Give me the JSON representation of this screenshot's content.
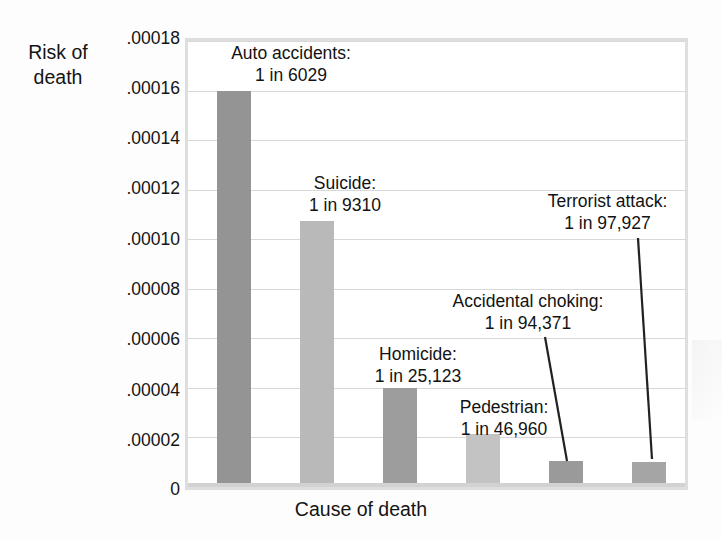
{
  "axes": {
    "y_title": "Risk of\ndeath",
    "x_title": "Cause of death",
    "y_ticks": [
      ".00018",
      ".00016",
      ".00014",
      ".00012",
      ".00010",
      ".00008",
      ".00006",
      ".00004",
      ".00002",
      "0"
    ]
  },
  "labels": {
    "auto": "Auto accidents:\n1 in 6029",
    "suicide": "Suicide:\n1 in 9310",
    "homicide": "Homicide:\n1 in 25,123",
    "pedestrian": "Pedestrian:\n1 in 46,960",
    "choking": "Accidental choking:\n1 in 94,371",
    "terrorist": "Terrorist attack:\n1 in 97,927"
  },
  "colors": {
    "bar_dark": "#949494",
    "bar_light": "#b9b9b9",
    "gridline": "#d8d8d8",
    "plot_border": "#dedede",
    "text": "#141414",
    "leader_line": "#222222"
  },
  "chart_data": {
    "type": "bar",
    "title": "",
    "xlabel": "Cause of death",
    "ylabel": "Risk of death",
    "ylim": [
      0,
      0.00018
    ],
    "ytick_values": [
      0.00018,
      0.00016,
      0.00014,
      0.00012,
      0.0001,
      8e-05,
      6e-05,
      4e-05,
      2e-05,
      0
    ],
    "ytick_labels": [
      ".00018",
      ".00016",
      ".00014",
      ".00012",
      ".00010",
      ".00008",
      ".00006",
      ".00004",
      ".00002",
      "0"
    ],
    "grid": true,
    "legend": "none",
    "categories": [
      "Auto accidents",
      "Suicide",
      "Homicide",
      "Pedestrian",
      "Accidental choking",
      "Terrorist attack"
    ],
    "values": [
      0.00016,
      0.0001074,
      3.98e-05,
      2.13e-05,
      1.06e-05,
      1.02e-05
    ],
    "odds_text": [
      "1 in 6029",
      "1 in 9310",
      "1 in 25,123",
      "1 in 46,960",
      "1 in 94,371",
      "1 in 97,927"
    ],
    "odds_denominator": [
      6029,
      9310,
      25123,
      46960,
      94371,
      97927
    ],
    "bar_colors": [
      "#949494",
      "#b9b9b9",
      "#9d9d9d",
      "#c3c3c3",
      "#9a9a9a",
      "#a5a5a5"
    ],
    "annotations": [
      {
        "label": "Accidental choking:\n1 in 94,371",
        "target": "Accidental choking",
        "leader": true
      },
      {
        "label": "Terrorist attack:\n1 in 97,927",
        "target": "Terrorist attack",
        "leader": true
      }
    ]
  }
}
